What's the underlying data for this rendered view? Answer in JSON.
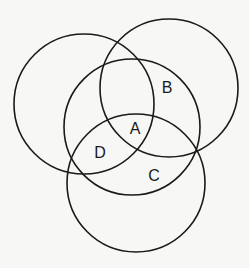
{
  "diagram": {
    "type": "venn",
    "stroke_color": "#1a1a1a",
    "background": "#f7f7f5",
    "circles": [
      {
        "name": "left",
        "cx": 84,
        "cy": 104,
        "r": 70
      },
      {
        "name": "top-right",
        "cx": 169,
        "cy": 88,
        "r": 69
      },
      {
        "name": "middle",
        "cx": 132,
        "cy": 127,
        "r": 68
      },
      {
        "name": "bottom",
        "cx": 136,
        "cy": 183,
        "r": 69
      }
    ],
    "labels": [
      {
        "text": "A",
        "x": 135,
        "y": 128
      },
      {
        "text": "B",
        "x": 167,
        "y": 87
      },
      {
        "text": "C",
        "x": 154,
        "y": 175
      },
      {
        "text": "D",
        "x": 100,
        "y": 152
      }
    ]
  }
}
